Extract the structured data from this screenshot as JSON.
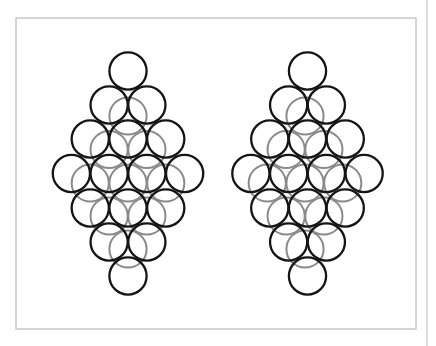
{
  "figure": {
    "width": 436,
    "height": 346,
    "frame": {
      "x": 16,
      "y": 18,
      "w": 400,
      "h": 311,
      "color": "#c8c8c8"
    },
    "edge_line": {
      "x": 427,
      "color": "#c8c8c8"
    },
    "circle_radius": 18.6,
    "front_color": "#151515",
    "back_color": "#8a8a8a",
    "front_stroke": 2.3,
    "back_stroke": 2.0,
    "col_spacing": 37.75,
    "front_rows_y": [
      71,
      105,
      139,
      173.5,
      208,
      242,
      276
    ],
    "front_rows_count": [
      1,
      2,
      3,
      4,
      3,
      2,
      1
    ],
    "back_rows_y": [
      116,
      149.5,
      183,
      216,
      249
    ],
    "back_rows_count": [
      1,
      2,
      3,
      2,
      1
    ]
  },
  "diagrams": [
    {
      "name": "left-stack",
      "front_cx": 128,
      "back_cx": 128
    },
    {
      "name": "right-stack",
      "front_cx": 307.5,
      "back_cx": 305
    }
  ]
}
